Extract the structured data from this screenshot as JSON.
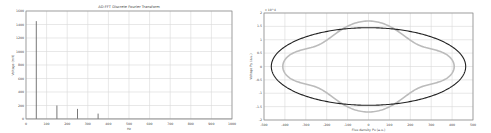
{
  "chart_data": [
    {
      "type": "line",
      "title": "AD-FFT Discrete Fourier Transform",
      "xlabel": "Hz",
      "ylabel": "Voltage (mV)",
      "xlim": [
        0,
        1000
      ],
      "ylim": [
        0,
        1600
      ],
      "xticks": [
        0,
        100,
        200,
        300,
        400,
        500,
        600,
        700,
        800,
        900,
        1000
      ],
      "yticks": [
        0,
        200,
        400,
        600,
        800,
        1000,
        1200,
        1400,
        1600
      ],
      "grid": true,
      "series": [
        {
          "name": "spectrum",
          "color": "#555555",
          "x": [
            50,
            150,
            250,
            350
          ],
          "values": [
            1450,
            200,
            150,
            80
          ]
        }
      ]
    },
    {
      "type": "line",
      "title": "",
      "xlabel": "Flux density Px (a.u.)",
      "ylabel": "Voltage Py (a.u.)",
      "y_exponent_label": "x 10^4",
      "xlim": [
        -500,
        500
      ],
      "ylim": [
        -2,
        2
      ],
      "xticks": [
        -500,
        -400,
        -300,
        -200,
        -100,
        0,
        100,
        200,
        300,
        400,
        500
      ],
      "yticks": [
        -2,
        -1.5,
        -1,
        -0.5,
        0,
        0.5,
        1,
        1.5,
        2
      ],
      "grid": true,
      "series": [
        {
          "name": "ellipse",
          "color": "#222222",
          "shape": "ellipse",
          "center": [
            0,
            0
          ],
          "semi_axes": [
            465,
            1.45
          ]
        },
        {
          "name": "modulated",
          "color": "#bbbbbb",
          "shape": "wavy-closed-curve",
          "extent_x": [
            -410,
            410
          ],
          "extent_y": [
            -1.7,
            1.7
          ]
        }
      ]
    }
  ]
}
